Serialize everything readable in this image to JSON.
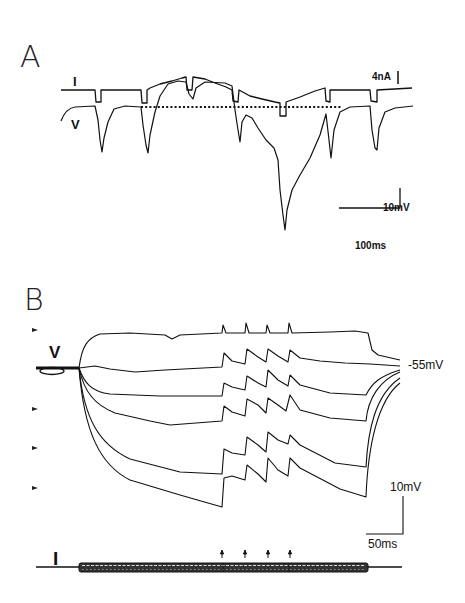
{
  "figure": {
    "panel_a": {
      "label": "A",
      "current_trace_label": "I",
      "voltage_trace_label": "V",
      "current_scale": "4nA",
      "voltage_scale": "10mV",
      "time_scale": "100ms"
    },
    "panel_b": {
      "label": "B",
      "voltage_trace_label": "V",
      "current_trace_label": "I",
      "resting_potential": "-55mV",
      "voltage_scale": "10mV",
      "time_scale": "50ms",
      "arrowhead_markers": 5,
      "stimulus_arrows": 4,
      "trace_count": 6
    }
  }
}
